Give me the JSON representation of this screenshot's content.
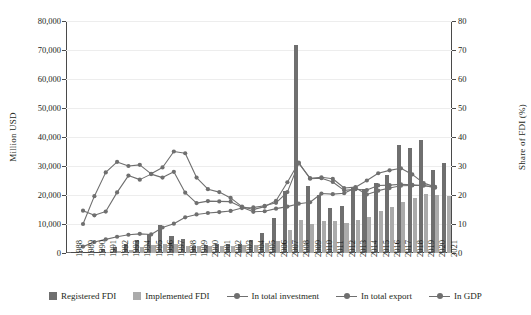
{
  "chart_data": {
    "type": "bar",
    "title": "",
    "xlabel": "",
    "ylabel": "Million USD",
    "y2label": "Share of FDI (%)",
    "ylim": [
      0,
      80000
    ],
    "y2lim": [
      0,
      80
    ],
    "ytick_labels": [
      "0",
      "10,000",
      "20,000",
      "30,000",
      "40,000",
      "50,000",
      "60,000",
      "70,000",
      "80,000"
    ],
    "y2tick_labels": [
      "0",
      "10",
      "20",
      "30",
      "40",
      "50",
      "60",
      "70",
      "80"
    ],
    "grid": true,
    "legend_position": "bottom",
    "categories": [
      "1988",
      "1989",
      "1990",
      "1991",
      "1992",
      "1993",
      "1994",
      "1995",
      "1996",
      "1997",
      "1998",
      "1999",
      "2000",
      "2001",
      "2002",
      "2003",
      "2004",
      "2005",
      "2006",
      "2007",
      "2008",
      "2009",
      "2010",
      "2011",
      "2012",
      "2013",
      "2014",
      "2015",
      "2016",
      "2017",
      "2018",
      "2019",
      "2020",
      "2021"
    ],
    "series": [
      {
        "name": "Registered FDI",
        "type": "bar",
        "axis": "left",
        "units": "Million USD",
        "color": "#6f6f6f",
        "values": [
          340,
          525,
          735,
          1290,
          2210,
          3140,
          4540,
          6670,
          9640,
          5950,
          4870,
          2280,
          2760,
          3270,
          2990,
          3190,
          4550,
          6840,
          12000,
          21350,
          71700,
          23100,
          19890,
          15600,
          16350,
          22350,
          21920,
          24120,
          26890,
          37100,
          36370,
          38950,
          28530,
          31150
        ]
      },
      {
        "name": "Implemented FDI",
        "type": "bar",
        "axis": "left",
        "units": "Million USD",
        "color": "#ababab",
        "values": [
          0,
          0,
          0,
          330,
          575,
          1120,
          2240,
          2790,
          2940,
          3220,
          2370,
          2330,
          2400,
          2450,
          2590,
          2650,
          2850,
          3310,
          4100,
          8030,
          11500,
          10000,
          11000,
          11000,
          10460,
          11500,
          12350,
          14500,
          15800,
          17500,
          19100,
          20380,
          19980,
          19740
        ]
      },
      {
        "name": "In total investment",
        "type": "line",
        "axis": "right",
        "units": "%",
        "color": "#6f6f6f",
        "values": [
          null,
          10.0,
          19.6,
          27.8,
          31.4,
          30.0,
          30.4,
          27.3,
          29.5,
          35.0,
          34.4,
          26.0,
          22.0,
          21.0,
          19.0,
          16.0,
          15.0,
          16.0,
          18.0,
          24.4,
          31.2,
          25.6,
          25.8,
          24.5,
          21.6,
          22.0,
          21.7,
          23.3,
          23.4,
          23.7,
          23.5,
          23.3,
          22.5,
          null
        ]
      },
      {
        "name": "In total export",
        "type": "line",
        "axis": "right",
        "units": "%",
        "color": "#6f6f6f",
        "values": [
          null,
          14.6,
          13.0,
          14.3,
          20.9,
          26.7,
          25.3,
          27.2,
          26.0,
          28.0,
          20.8,
          17.2,
          17.9,
          17.8,
          17.7,
          15.8,
          14.2,
          14.4,
          15.3,
          16.0,
          17.0,
          17.5,
          20.5,
          20.3,
          20.6,
          22.5,
          20.2,
          21.5,
          22.4,
          23.2,
          23.3,
          23.3,
          22.7,
          null
        ]
      },
      {
        "name": "In GDP",
        "type": "line",
        "axis": "right",
        "units": "%",
        "color": "#6f6f6f",
        "values": [
          null,
          2.2,
          3.8,
          4.7,
          5.6,
          6.3,
          6.6,
          6.4,
          8.8,
          10.1,
          12.3,
          13.3,
          13.8,
          14.1,
          14.5,
          15.5,
          15.7,
          16.3,
          17.3,
          21.0,
          30.9,
          25.8,
          26.1,
          25.6,
          22.4,
          22.7,
          25.0,
          27.5,
          28.5,
          29.2,
          27.1,
          24.1,
          22.8,
          null
        ]
      }
    ]
  },
  "legend": {
    "items": [
      {
        "label": "Registered FDI",
        "marker": "bar",
        "color": "#6f6f6f"
      },
      {
        "label": "Implemented FDI",
        "marker": "bar",
        "color": "#ababab"
      },
      {
        "label": "In total investment",
        "marker": "line",
        "color": "#6f6f6f"
      },
      {
        "label": "In total export",
        "marker": "line",
        "color": "#6f6f6f"
      },
      {
        "label": "In GDP",
        "marker": "line",
        "color": "#6f6f6f"
      }
    ]
  }
}
